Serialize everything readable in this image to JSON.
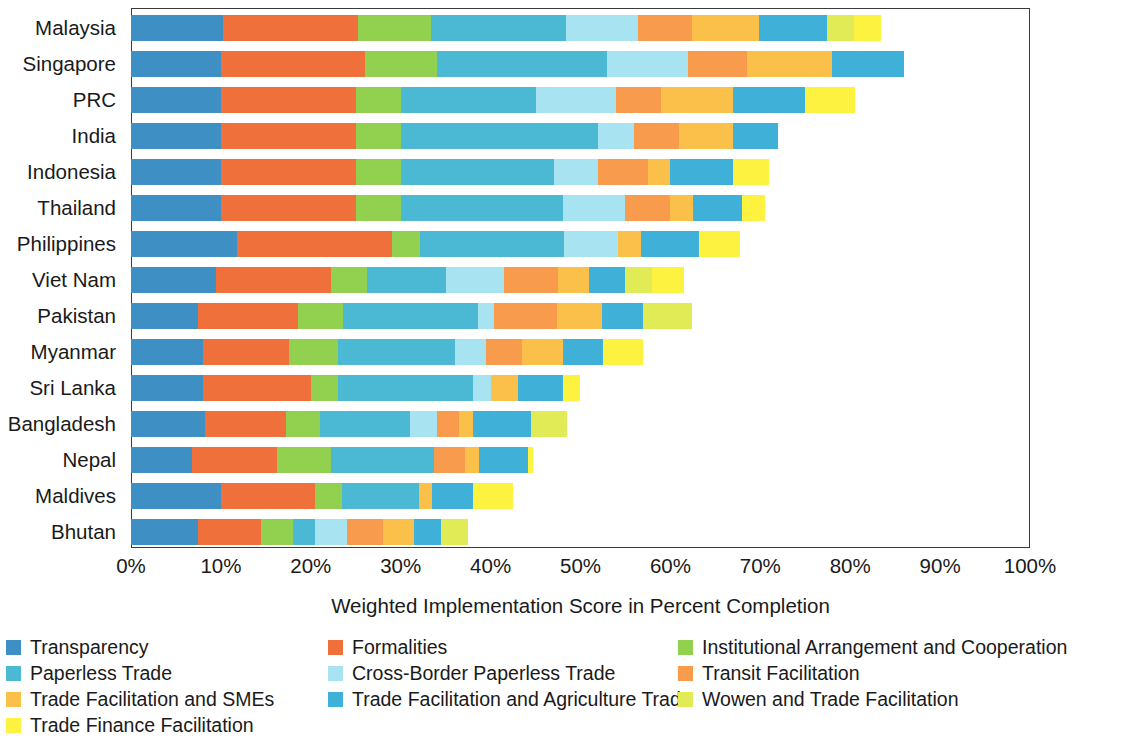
{
  "chart_data": {
    "type": "bar",
    "orientation": "horizontal",
    "stacked": true,
    "title": "",
    "xlabel": "Weighted Implementation Score in Percent Completion",
    "ylabel": "",
    "xlim": [
      0,
      100
    ],
    "xticks": [
      "0%",
      "10%",
      "20%",
      "30%",
      "40%",
      "50%",
      "60%",
      "70%",
      "80%",
      "90%",
      "100%"
    ],
    "xtick_values": [
      0,
      10,
      20,
      30,
      40,
      50,
      60,
      70,
      80,
      90,
      100
    ],
    "grid": false,
    "legend_position": "bottom",
    "categories": [
      "Malaysia",
      "Singapore",
      "PRC",
      "India",
      "Indonesia",
      "Thailand",
      "Philippines",
      "Viet Nam",
      "Pakistan",
      "Myanmar",
      "Sri Lanka",
      "Bangladesh",
      "Nepal",
      "Maldives",
      "Bhutan"
    ],
    "series": [
      {
        "name": "Transparency",
        "color": "#3E8FC4",
        "values": [
          10.2,
          10.0,
          10.0,
          10.0,
          10.0,
          10.0,
          11.8,
          9.5,
          7.4,
          8.0,
          8.0,
          8.2,
          6.8,
          10.0,
          7.5
        ]
      },
      {
        "name": "Formalities",
        "color": "#F0703C",
        "values": [
          15.0,
          16.0,
          15.0,
          15.0,
          15.0,
          15.0,
          17.2,
          12.7,
          11.2,
          9.6,
          12.0,
          9.0,
          9.4,
          10.5,
          7.0
        ]
      },
      {
        "name": "Institutional Arrangement and Cooperation",
        "color": "#92D050",
        "values": [
          8.2,
          8.0,
          5.0,
          5.0,
          5.0,
          5.0,
          3.2,
          4.0,
          5.0,
          5.4,
          3.0,
          3.8,
          6.0,
          3.0,
          3.5
        ]
      },
      {
        "name": "Paperless Trade",
        "color": "#4BB8D4",
        "values": [
          15.0,
          19.0,
          15.0,
          22.0,
          17.0,
          18.0,
          16.0,
          8.8,
          15.0,
          13.0,
          15.0,
          10.0,
          11.5,
          8.5,
          2.5
        ]
      },
      {
        "name": "Cross-Border Paperless Trade",
        "color": "#A8E3F2",
        "values": [
          8.0,
          9.0,
          9.0,
          4.0,
          5.0,
          7.0,
          6.0,
          6.5,
          1.8,
          3.5,
          2.0,
          3.0,
          0.0,
          0.0,
          3.5
        ]
      },
      {
        "name": "Transit Facilitation",
        "color": "#F89B4C",
        "values": [
          6.0,
          6.5,
          5.0,
          5.0,
          5.5,
          5.0,
          0.0,
          6.0,
          7.0,
          4.0,
          0.0,
          2.5,
          3.5,
          0.0,
          4.0
        ]
      },
      {
        "name": "Trade Facilitation and SMEs",
        "color": "#FAC049",
        "values": [
          7.5,
          9.5,
          8.0,
          6.0,
          2.5,
          2.5,
          2.5,
          3.5,
          5.0,
          4.5,
          3.0,
          1.5,
          1.5,
          1.5,
          3.5
        ]
      },
      {
        "name": "Trade Facilitation and Agriculture Trade",
        "color": "#3FB0D8",
        "values": [
          7.5,
          8.0,
          8.0,
          5.0,
          7.0,
          5.5,
          6.5,
          4.0,
          4.5,
          4.5,
          5.0,
          6.5,
          5.5,
          4.5,
          3.0
        ]
      },
      {
        "name": "Wowen and Trade Facilitation",
        "color": "#E1EB55",
        "values": [
          3.0,
          0.0,
          0.0,
          0.0,
          0.0,
          0.0,
          0.0,
          3.0,
          5.5,
          0.0,
          0.0,
          4.0,
          0.0,
          0.0,
          3.0
        ]
      },
      {
        "name": "Trade Finance Facilitation",
        "color": "#FDF23F",
        "values": [
          3.0,
          0.0,
          5.5,
          0.0,
          4.0,
          2.5,
          4.5,
          3.5,
          0.0,
          4.5,
          2.0,
          0.0,
          0.5,
          4.5,
          0.0
        ]
      }
    ],
    "totals": [
      83.4,
      86.0,
      80.5,
      72.0,
      71.0,
      70.5,
      67.7,
      61.5,
      62.4,
      57.0,
      50.0,
      48.5,
      44.7,
      42.5,
      37.5
    ]
  },
  "legend": {
    "items": [
      {
        "label": "Transparency",
        "color": "#3E8FC4"
      },
      {
        "label": "Formalities",
        "color": "#F0703C"
      },
      {
        "label": "Institutional Arrangement and Cooperation",
        "color": "#92D050"
      },
      {
        "label": "Paperless Trade",
        "color": "#4BB8D4"
      },
      {
        "label": "Cross-Border Paperless Trade",
        "color": "#A8E3F2"
      },
      {
        "label": "Transit Facilitation",
        "color": "#F89B4C"
      },
      {
        "label": "Trade Facilitation and SMEs",
        "color": "#FAC049"
      },
      {
        "label": "Trade Facilitation and Agriculture Trade",
        "color": "#3FB0D8"
      },
      {
        "label": "Wowen and Trade Facilitation",
        "color": "#E1EB55"
      },
      {
        "label": "Trade Finance Facilitation",
        "color": "#FDF23F"
      }
    ]
  },
  "axis": {
    "title": "Weighted Implementation Score in Percent Completion"
  }
}
